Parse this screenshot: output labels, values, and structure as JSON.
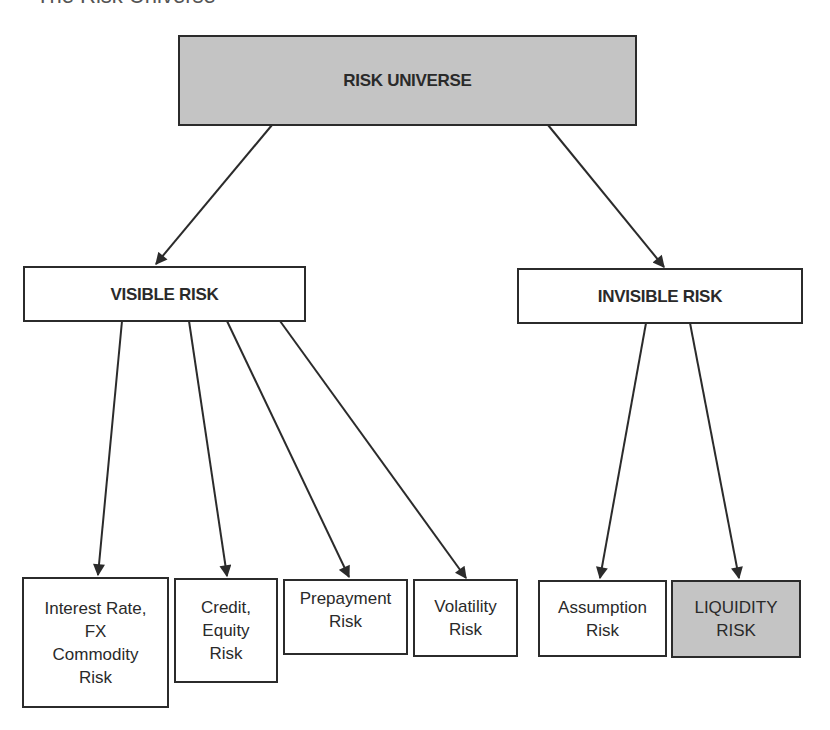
{
  "title": "The Risk Universe",
  "colors": {
    "line": "#2b2b2b",
    "shaded_fill": "#c4c4c4",
    "plain_fill": "#ffffff"
  },
  "root": {
    "label": "RISK UNIVERSE",
    "shaded": true
  },
  "branches": [
    {
      "label": "VISIBLE RISK",
      "children": [
        {
          "lines": [
            "Interest Rate,",
            "FX",
            "Commodity",
            "Risk"
          ]
        },
        {
          "lines": [
            "Credit,",
            "Equity",
            "Risk"
          ]
        },
        {
          "lines": [
            "Prepayment",
            "Risk"
          ]
        },
        {
          "lines": [
            "Volatility",
            "Risk"
          ]
        }
      ]
    },
    {
      "label": "INVISIBLE RISK",
      "children": [
        {
          "lines": [
            "Assumption",
            "Risk"
          ]
        },
        {
          "lines": [
            "LIQUIDITY",
            "RISK"
          ],
          "shaded": true
        }
      ]
    }
  ]
}
